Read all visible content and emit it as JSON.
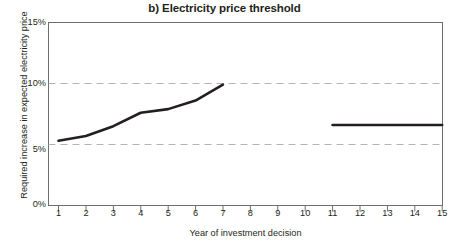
{
  "chart_data": {
    "type": "line",
    "title": "b) Electricity price threshold",
    "xlabel": "Year of investment decision",
    "ylabel": "Required increase in expected electricity price",
    "x": [
      1,
      2,
      3,
      4,
      5,
      6,
      7,
      8,
      9,
      10,
      11,
      12,
      13,
      14,
      15
    ],
    "xtick_labels": [
      "1",
      "2",
      "3",
      "4",
      "5",
      "6",
      "7",
      "8",
      "9",
      "10",
      "11",
      "12",
      "13",
      "14",
      "15"
    ],
    "ytick_labels": [
      "0%",
      "5%",
      "10%",
      "15%"
    ],
    "ytick_values": [
      0,
      5,
      10,
      15
    ],
    "xlim": [
      0.5,
      15.5
    ],
    "ylim": [
      0,
      15
    ],
    "grid": "horizontal-dashed-at-5-and-10",
    "legend": "none",
    "series": [
      {
        "name": "Years 1-7 segment",
        "x": [
          1,
          2,
          3,
          4,
          5,
          6,
          7
        ],
        "values": [
          5.3,
          5.7,
          6.5,
          7.6,
          7.9,
          8.6,
          9.9
        ]
      },
      {
        "name": "Years 11-15 segment",
        "x": [
          11,
          12,
          13,
          14,
          15
        ],
        "values": [
          6.6,
          6.6,
          6.6,
          6.6,
          6.6
        ]
      }
    ],
    "colors": {
      "line": "#231f20",
      "grid": "#b3b3b3",
      "axis": "#6d6e71",
      "text": "#231f20",
      "background": "#ffffff"
    }
  }
}
